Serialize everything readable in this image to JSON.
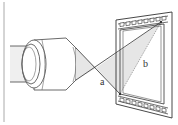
{
  "diagram": {
    "labels": {
      "a": "a",
      "b": "b"
    },
    "colors": {
      "stroke": "#333333",
      "light_fill": "#eeeeee",
      "cone_fill": "#e4e4e4",
      "border": "#999999"
    }
  }
}
